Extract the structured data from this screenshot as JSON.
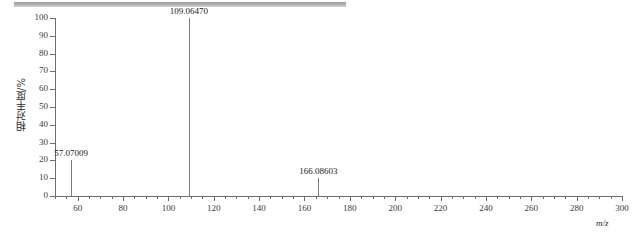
{
  "figure": {
    "scan_bar_name": "scan-progress-bar",
    "accent_color": "#9d9d9d",
    "axis_color": "#6e6e6e",
    "peak_color": "#7a7a7a"
  },
  "chart_data": {
    "type": "bar",
    "title": "",
    "subtitle": "",
    "xlabel": "m/z",
    "ylabel": "相对丰度/%",
    "xlim": [
      50,
      300
    ],
    "ylim": [
      0,
      100
    ],
    "grid": false,
    "legend": null,
    "x_ticks": [
      60,
      80,
      100,
      120,
      140,
      160,
      180,
      200,
      220,
      240,
      260,
      280,
      300
    ],
    "x_tick_labels": [
      "60",
      "80",
      "100",
      "120",
      "140",
      "160",
      "180",
      "200",
      "220",
      "240",
      "260",
      "280",
      "300"
    ],
    "x_minor_step": 5,
    "y_ticks": [
      0,
      10,
      20,
      30,
      40,
      50,
      60,
      70,
      80,
      90,
      100
    ],
    "y_tick_labels": [
      "0",
      "10",
      "20",
      "30",
      "40",
      "50",
      "60",
      "70",
      "80",
      "90",
      "100"
    ],
    "x": [
      57.07009,
      109.0647,
      166.08603
    ],
    "values": [
      20,
      100,
      10
    ],
    "annotations": [
      {
        "label": "57.07009",
        "x": 57.07009,
        "y": 20
      },
      {
        "label": "109.06470",
        "x": 109.0647,
        "y": 100
      },
      {
        "label": "166.08603",
        "x": 166.08603,
        "y": 10
      }
    ]
  }
}
